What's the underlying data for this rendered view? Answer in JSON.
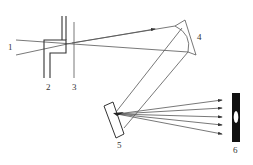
{
  "diagram": {
    "type": "optical-spectrograph-schematic",
    "labels": {
      "incident_beam": "1",
      "slit": "2",
      "aperture": "3",
      "concave_mirror": "4",
      "grating": "5",
      "detector": "6"
    },
    "colors": {
      "line": "#555555",
      "detector": "#111111",
      "background": "#ffffff"
    }
  }
}
